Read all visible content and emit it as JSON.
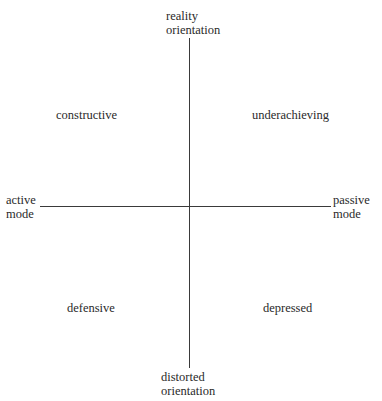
{
  "diagram": {
    "axes": {
      "vertical": {
        "top_label": [
          "reality",
          "orientation"
        ],
        "bottom_label": [
          "distorted",
          "orientation"
        ]
      },
      "horizontal": {
        "left_label": [
          "active",
          "mode"
        ],
        "right_label": [
          "passive",
          "mode"
        ]
      }
    },
    "quadrants": {
      "top_left": "constructive",
      "top_right": "underachieving",
      "bottom_left": "defensive",
      "bottom_right": "depressed"
    },
    "colors": {
      "axis": "#3a3a3a",
      "text": "#2a2a2a",
      "background": "#ffffff"
    }
  }
}
